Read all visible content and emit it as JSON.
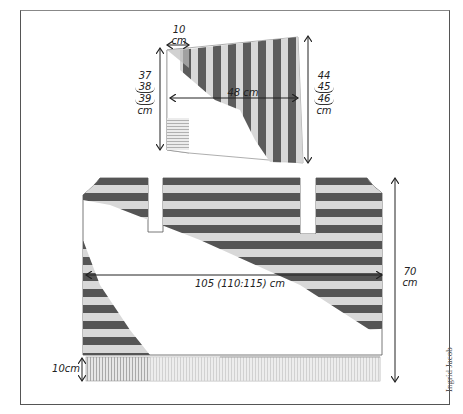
{
  "sleeve": {
    "cuff_width": {
      "value": "10",
      "unit": "cm"
    },
    "width": "48 cm",
    "left_height": {
      "values": [
        "37",
        "38",
        "39"
      ],
      "unit": "cm"
    },
    "right_height": {
      "values": [
        "44",
        "45",
        "46"
      ],
      "unit": "cm"
    }
  },
  "body": {
    "width": "105 (110:115) cm",
    "height": {
      "value": "70",
      "unit": "cm"
    },
    "ribbing": "10cm"
  },
  "credit": "Ingrid Jacob",
  "colors": {
    "stripe_dark": "#555555",
    "stripe_light": "#c8c8c8",
    "outline": "#333333",
    "background": "#ffffff"
  }
}
